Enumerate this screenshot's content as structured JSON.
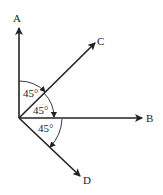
{
  "diagram": {
    "origin": {
      "x": 19,
      "y": 118
    },
    "rays": [
      {
        "id": "A",
        "label": "A",
        "tip": {
          "x": 19,
          "y": 27
        },
        "label_pos": {
          "x": 17,
          "y": 22
        }
      },
      {
        "id": "C",
        "label": "C",
        "tip": {
          "x": 95,
          "y": 43
        },
        "label_pos": {
          "x": 101,
          "y": 45
        }
      },
      {
        "id": "B",
        "label": "B",
        "tip": {
          "x": 142,
          "y": 118
        },
        "label_pos": {
          "x": 150,
          "y": 122
        }
      },
      {
        "id": "D",
        "label": "D",
        "tip": {
          "x": 80,
          "y": 176
        },
        "label_pos": {
          "x": 87,
          "y": 184
        }
      }
    ],
    "angles": [
      {
        "between": "A-C",
        "label": "45°"
      },
      {
        "between": "C-B",
        "label": "45°"
      },
      {
        "between": "B-D",
        "label": "45°"
      }
    ],
    "stroke_color": "#222222"
  }
}
